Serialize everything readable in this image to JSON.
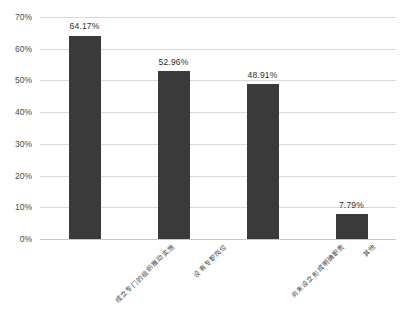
{
  "chart_data": {
    "type": "bar",
    "title": "",
    "subtitle": "",
    "xlabel": "",
    "ylabel": "",
    "categories": [
      "成立专门的组织推动实施",
      "设有专职岗位",
      "尚未设立形成明确职责",
      "其他"
    ],
    "values": [
      64.17,
      52.96,
      48.91,
      7.79
    ],
    "data_labels": [
      "64.17%",
      "52.96%",
      "48.91%",
      "7.79%"
    ],
    "ylim": [
      0,
      70
    ],
    "ytick_values": [
      0,
      10,
      20,
      30,
      40,
      50,
      60,
      70
    ],
    "ytick_labels": [
      "0%",
      "10%",
      "20%",
      "30%",
      "40%",
      "50%",
      "60%",
      "70%"
    ],
    "grid": true,
    "legend": false,
    "legend_position": "none",
    "bar_color": "#3a3a3a",
    "gridline_color": "#d9d9d9",
    "axis_color": "#c8c8c8",
    "label_color": "#4a4a4a",
    "background": "#ffffff",
    "xtick_rotation_degrees": -45
  }
}
